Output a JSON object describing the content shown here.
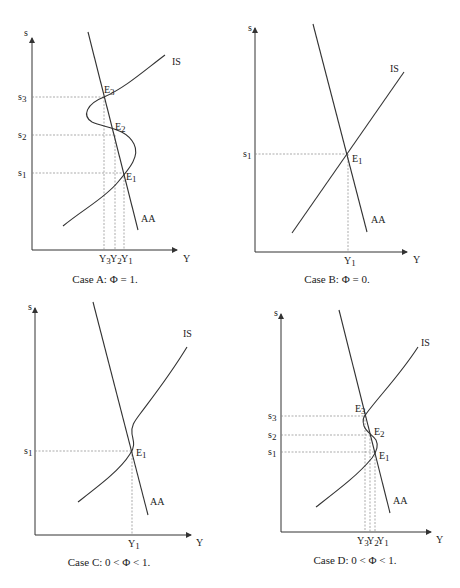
{
  "panels": [
    {
      "id": "A",
      "caption": "Case A:  Φ = 1.",
      "y_axis_label": "s",
      "x_axis_label": "Y",
      "curve_labels": {
        "is": "IS",
        "aa": "AA"
      },
      "equilibria": [
        {
          "label": "E",
          "sub": "3",
          "s_label": "s",
          "s_sub": "3",
          "y_label": "Y",
          "y_sub": "3"
        },
        {
          "label": "E",
          "sub": "2",
          "s_label": "s",
          "s_sub": "2",
          "y_label": "Y",
          "y_sub": "2"
        },
        {
          "label": "E",
          "sub": "1",
          "s_label": "s",
          "s_sub": "1",
          "y_label": "Y",
          "y_sub": "1"
        }
      ]
    },
    {
      "id": "B",
      "caption": "Case B:  Φ = 0.",
      "y_axis_label": "s",
      "x_axis_label": "Y",
      "curve_labels": {
        "is": "IS",
        "aa": "AA"
      },
      "equilibria": [
        {
          "label": "E",
          "sub": "1",
          "s_label": "s",
          "s_sub": "1",
          "y_label": "Y",
          "y_sub": "1"
        }
      ]
    },
    {
      "id": "C",
      "caption": "Case C:  0 < Φ < 1.",
      "y_axis_label": "s",
      "x_axis_label": "Y",
      "curve_labels": {
        "is": "IS",
        "aa": "AA"
      },
      "equilibria": [
        {
          "label": "E",
          "sub": "1",
          "s_label": "s",
          "s_sub": "1",
          "y_label": "Y",
          "y_sub": "1"
        }
      ]
    },
    {
      "id": "D",
      "caption": "Case D:  0 < Φ < 1.",
      "y_axis_label": "s",
      "x_axis_label": "Y",
      "curve_labels": {
        "is": "IS",
        "aa": "AA"
      },
      "equilibria": [
        {
          "label": "E",
          "sub": "3",
          "s_label": "s",
          "s_sub": "3",
          "y_label": "Y",
          "y_sub": "3"
        },
        {
          "label": "E",
          "sub": "2",
          "s_label": "s",
          "s_sub": "2",
          "y_label": "Y",
          "y_sub": "2"
        },
        {
          "label": "E",
          "sub": "1",
          "s_label": "s",
          "s_sub": "1",
          "y_label": "Y",
          "y_sub": "1"
        }
      ]
    }
  ]
}
